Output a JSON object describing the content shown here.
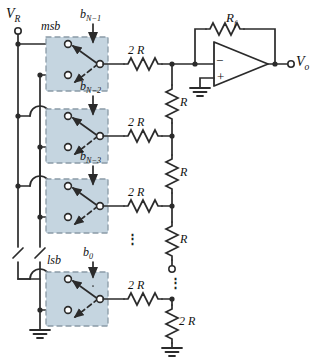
{
  "figure": {
    "colors": {
      "wire": "#2b2b2b",
      "switch_fill": "#c5d5e0",
      "switch_border": "#8a9aa6",
      "text": "#111111"
    },
    "terminals": [
      {
        "name": "reference-voltage",
        "label": "V",
        "sub": "R"
      },
      {
        "name": "output-voltage",
        "label": "V",
        "sub": "o"
      }
    ],
    "labels": {
      "vr": "V",
      "vr_sub": "R",
      "vo": "V",
      "vo_sub": "o",
      "msb": "msb",
      "lsb": "lsb",
      "rf": "R",
      "rf_sub": "f",
      "r": "R",
      "two_r": "2 R",
      "ellipsis": "⋮"
    },
    "bits": [
      {
        "name": "bit-msb",
        "label": "b",
        "sub": "N−1",
        "tag": "msb"
      },
      {
        "name": "bit-n-2",
        "label": "b",
        "sub": "N−2",
        "tag": ""
      },
      {
        "name": "bit-n-3",
        "label": "b",
        "sub": "N−3",
        "tag": ""
      },
      {
        "name": "bit-lsb",
        "label": "b",
        "sub": "0",
        "tag": "lsb"
      }
    ],
    "series_resistors": [
      {
        "name": "series-2r-msb",
        "value": "2 R"
      },
      {
        "name": "series-2r-n2",
        "value": "2 R"
      },
      {
        "name": "series-2r-n3",
        "value": "2 R"
      },
      {
        "name": "series-2r-lsb",
        "value": "2 R"
      }
    ],
    "ladder_resistors": [
      {
        "name": "ladder-r-1",
        "value": "R"
      },
      {
        "name": "ladder-r-2",
        "value": "R"
      },
      {
        "name": "ladder-r-3",
        "value": "R"
      },
      {
        "name": "terminating-2r",
        "value": "2 R"
      }
    ],
    "feedback_resistor": {
      "name": "feedback-rf",
      "value": "R",
      "sub": "f"
    },
    "opamp": {
      "name": "operational-amplifier",
      "inverting": "−",
      "noninverting": "+"
    }
  }
}
